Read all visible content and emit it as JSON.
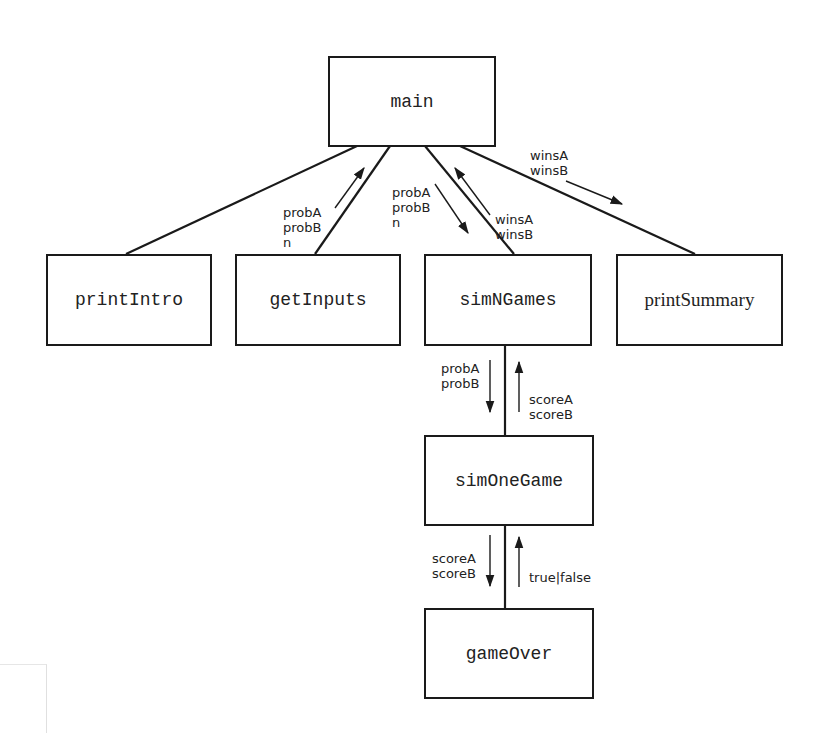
{
  "diagram": {
    "nodes": {
      "main": {
        "label": "main",
        "font": "mono"
      },
      "printIntro": {
        "label": "printIntro",
        "font": "mono"
      },
      "getInputs": {
        "label": "getInputs",
        "font": "mono"
      },
      "simNGames": {
        "label": "simNGames",
        "font": "mono"
      },
      "printSummary": {
        "label": "printSummary",
        "font": "serif"
      },
      "simOneGame": {
        "label": "simOneGame",
        "font": "mono"
      },
      "gameOver": {
        "label": "gameOver",
        "font": "mono"
      }
    },
    "edges": [
      {
        "from": "main",
        "to": "printIntro"
      },
      {
        "from": "main",
        "to": "getInputs"
      },
      {
        "from": "main",
        "to": "simNGames"
      },
      {
        "from": "main",
        "to": "printSummary"
      },
      {
        "from": "simNGames",
        "to": "simOneGame"
      },
      {
        "from": "simOneGame",
        "to": "gameOver"
      }
    ],
    "flows": {
      "getInputs_to_main": {
        "text": "probA\nprobB\nn",
        "direction": "up"
      },
      "main_to_simNGames": {
        "text": "probA\nprobB\nn",
        "direction": "down"
      },
      "simNGames_to_main": {
        "text": "winsA\nwinsB",
        "direction": "up"
      },
      "main_to_printSummary": {
        "text": "winsA\nwinsB",
        "direction": "down"
      },
      "simNGames_to_simOneGame": {
        "text": "probA\nprobB",
        "direction": "down"
      },
      "simOneGame_to_simNGames": {
        "text": "scoreA\nscoreB",
        "direction": "up"
      },
      "simOneGame_to_gameOver": {
        "text": "scoreA\nscoreB",
        "direction": "down"
      },
      "gameOver_to_simOneGame": {
        "text": "true|false",
        "direction": "up"
      }
    },
    "colors": {
      "line": "#1a1a1a",
      "text": "#222222",
      "background": "#ffffff"
    }
  }
}
